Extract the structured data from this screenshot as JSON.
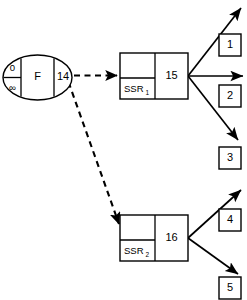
{
  "diagram": {
    "type": "state-transition-flow-diagram",
    "background_color": "#ffffff",
    "stroke_color": "#000000",
    "source_node": {
      "id": "source-oval",
      "shape": "oval",
      "cells": [
        {
          "id": "cost-upper",
          "label": "0"
        },
        {
          "id": "cost-lower",
          "label": "∞"
        },
        {
          "id": "state-label",
          "label": "F"
        },
        {
          "id": "state-value",
          "label": "14"
        }
      ]
    },
    "ssr_nodes": [
      {
        "id": "ssr-1",
        "name": "SSR",
        "subscript": "1",
        "value": "15"
      },
      {
        "id": "ssr-2",
        "name": "SSR",
        "subscript": "2",
        "value": "16"
      }
    ],
    "terminal_boxes": [
      {
        "id": "terminal-1",
        "label": "1"
      },
      {
        "id": "terminal-2",
        "label": "2"
      },
      {
        "id": "terminal-3",
        "label": "3"
      },
      {
        "id": "terminal-4",
        "label": "4"
      },
      {
        "id": "terminal-5",
        "label": "5"
      }
    ],
    "edges": [
      {
        "id": "edge-source-to-ssr1",
        "style": "dashed",
        "direction": "source-to-ssr1"
      },
      {
        "id": "edge-ssr2-to-source",
        "style": "dashed",
        "direction": "bidirectional-diagonal"
      },
      {
        "id": "edge-ssr1-out-up",
        "style": "solid",
        "direction": "up-right"
      },
      {
        "id": "edge-ssr1-out-mid",
        "style": "solid",
        "direction": "right"
      },
      {
        "id": "edge-ssr1-out-down",
        "style": "solid",
        "direction": "down-right"
      },
      {
        "id": "edge-ssr2-out-up",
        "style": "solid",
        "direction": "up-right"
      },
      {
        "id": "edge-ssr2-out-down",
        "style": "solid",
        "direction": "down-right"
      }
    ]
  }
}
